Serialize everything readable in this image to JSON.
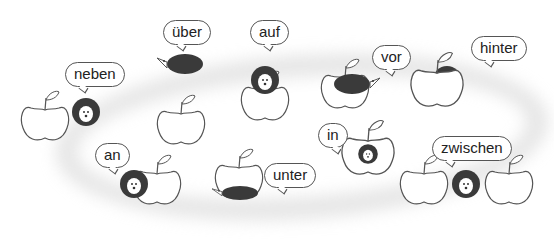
{
  "colors": {
    "line": "#555555",
    "hedgehog": "#3a3a3a",
    "ring": "#cfcfcf",
    "background": "#ffffff"
  },
  "prepositions": [
    {
      "label": "neben",
      "meaning": "hedgehog next to apple"
    },
    {
      "label": "über",
      "meaning": "hedgehog above apple"
    },
    {
      "label": "auf",
      "meaning": "hedgehog on apple"
    },
    {
      "label": "vor",
      "meaning": "hedgehog in front of apple"
    },
    {
      "label": "hinter",
      "meaning": "hedgehog behind apple"
    },
    {
      "label": "an",
      "meaning": "hedgehog at apple"
    },
    {
      "label": "unter",
      "meaning": "hedgehog under apple"
    },
    {
      "label": "in",
      "meaning": "hedgehog in apple"
    },
    {
      "label": "zwischen",
      "meaning": "hedgehog between apples"
    }
  ]
}
